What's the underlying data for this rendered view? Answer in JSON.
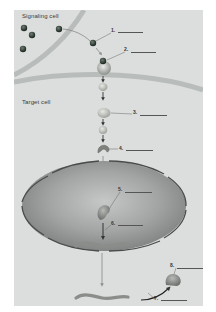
{
  "figure": {
    "signaling_cell_label": "Signaling cell",
    "target_cell_label": "Target cell",
    "callouts": [
      {
        "number": "1.",
        "answer": ""
      },
      {
        "number": "2.",
        "answer": ""
      },
      {
        "number": "3.",
        "answer": ""
      },
      {
        "number": "4.",
        "answer": ""
      },
      {
        "number": "5.",
        "answer": ""
      },
      {
        "number": "6.",
        "answer": ""
      },
      {
        "number": "7.",
        "answer": ""
      },
      {
        "number": "8.",
        "answer": ""
      }
    ],
    "colors": {
      "background": "#dcdedd",
      "membrane": "#b8bcba",
      "nucleus_fill": "#9a9c9b",
      "nucleus_edge": "#4a4c4b",
      "ligand": "#2e3a32",
      "protein": "#b9bdb7",
      "arrow": "#333333",
      "nuclear_arrow": "#8f8f8f"
    }
  }
}
